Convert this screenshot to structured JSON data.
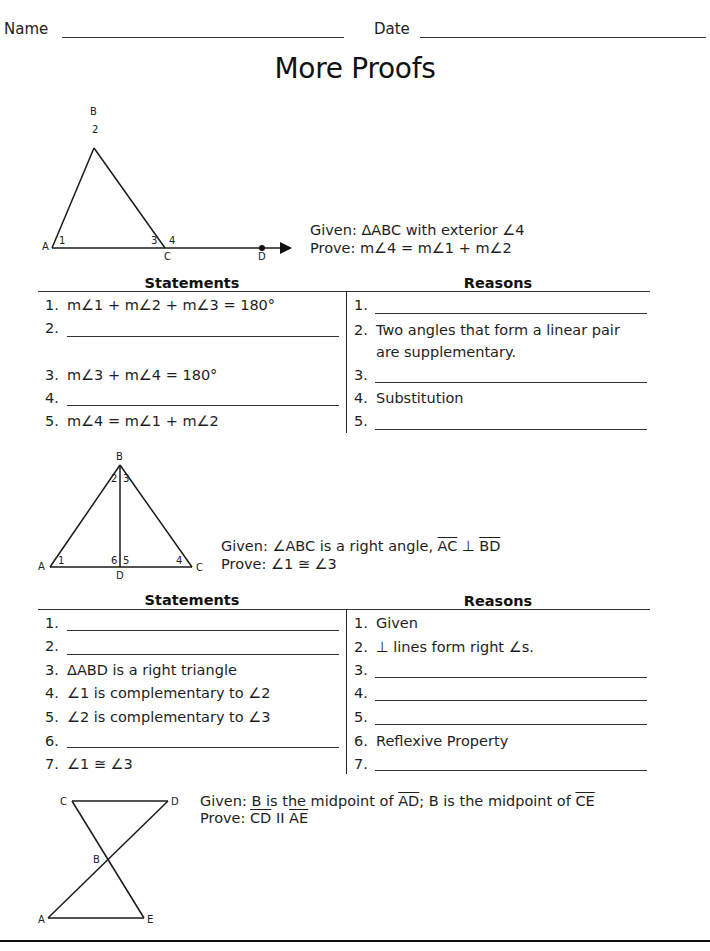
{
  "header": {
    "name_label": "Name",
    "date_label": "Date",
    "title": "More Proofs"
  },
  "problems": [
    {
      "diagram": {
        "points": [
          "A",
          "B",
          "C",
          "D"
        ],
        "angle_labels": [
          "1",
          "2",
          "3",
          "4"
        ]
      },
      "given": "Given: ΔABC with exterior ∠4",
      "prove": "Prove: m∠4 = m∠1 + m∠2",
      "statements_header": "Statements",
      "reasons_header": "Reasons",
      "statements": [
        {
          "num": "1.",
          "text": "m∠1 + m∠2 + m∠3 = 180°"
        },
        {
          "num": "2.",
          "text": ""
        },
        {
          "num": "3.",
          "text": "m∠3 + m∠4 = 180°"
        },
        {
          "num": "4.",
          "text": ""
        },
        {
          "num": "5.",
          "text": "m∠4 = m∠1 + m∠2"
        }
      ],
      "reasons": [
        {
          "num": "1.",
          "text": ""
        },
        {
          "num": "2.",
          "text": "Two angles that form a linear pair",
          "text2": "are supplementary."
        },
        {
          "num": "3.",
          "text": ""
        },
        {
          "num": "4.",
          "text": "Substitution"
        },
        {
          "num": "5.",
          "text": ""
        }
      ]
    },
    {
      "diagram": {
        "points": [
          "A",
          "B",
          "C",
          "D"
        ],
        "angle_labels": [
          "1",
          "2",
          "3",
          "4",
          "5",
          "6"
        ]
      },
      "given_prefix": "Given: ∠ABC is a right angle, ",
      "given_seg1": "AC",
      "given_mid": " ⊥ ",
      "given_seg2": "BD",
      "prove": "Prove: ∠1 ≅ ∠3",
      "statements_header": "Statements",
      "reasons_header": "Reasons",
      "statements": [
        {
          "num": "1.",
          "text": ""
        },
        {
          "num": "2.",
          "text": ""
        },
        {
          "num": "3.",
          "text": "ΔABD is a right triangle"
        },
        {
          "num": "4.",
          "text": "∠1 is complementary to ∠2"
        },
        {
          "num": "5.",
          "text": "∠2 is complementary to ∠3"
        },
        {
          "num": "6.",
          "text": ""
        },
        {
          "num": "7.",
          "text": "∠1 ≅ ∠3"
        }
      ],
      "reasons": [
        {
          "num": "1.",
          "text": "Given"
        },
        {
          "num": "2.",
          "text": "⊥ lines form right ∠s."
        },
        {
          "num": "3.",
          "text": ""
        },
        {
          "num": "4.",
          "text": ""
        },
        {
          "num": "5.",
          "text": ""
        },
        {
          "num": "6.",
          "text": "Reflexive Property"
        },
        {
          "num": "7.",
          "text": ""
        }
      ]
    },
    {
      "diagram": {
        "points": [
          "A",
          "B",
          "C",
          "D",
          "E"
        ]
      },
      "given_prefix": "Given: B is the midpoint of ",
      "given_seg1": "AD",
      "given_mid": "; B is the midpoint of ",
      "given_seg2": "CE",
      "prove_prefix": "Prove: ",
      "prove_seg1": "CD",
      "prove_mid": " II ",
      "prove_seg2": "AE"
    }
  ]
}
